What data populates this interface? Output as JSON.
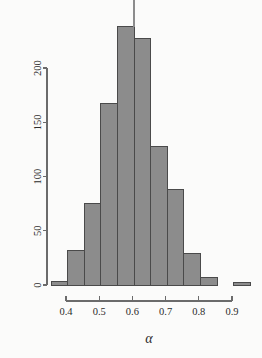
{
  "chart_data": {
    "type": "bar",
    "title": "",
    "subtitle": "",
    "xlabel": "α",
    "ylabel": "",
    "grid": false,
    "legend": false,
    "legend_position": "none",
    "bin_width": 0.05,
    "xlim": [
      0.355,
      0.955
    ],
    "ylim": [
      0,
      245
    ],
    "xticks": [
      0.4,
      0.5,
      0.6,
      0.7,
      0.8,
      0.9
    ],
    "xtick_labels": [
      "0.4",
      "0.5",
      "0.6",
      "0.7",
      "0.8",
      "0.9"
    ],
    "yticks": [
      0,
      50,
      100,
      150,
      200
    ],
    "ytick_labels": [
      "0",
      "50",
      "100",
      "150",
      "200"
    ],
    "bin_edges": [
      0.355,
      0.405,
      0.455,
      0.505,
      0.555,
      0.605,
      0.655,
      0.705,
      0.755,
      0.805,
      0.855,
      0.905,
      0.955
    ],
    "categories": [
      "0.355-0.405",
      "0.405-0.455",
      "0.455-0.505",
      "0.505-0.555",
      "0.555-0.605",
      "0.605-0.655",
      "0.655-0.705",
      "0.705-0.755",
      "0.755-0.805",
      "0.805-0.855",
      "0.855-0.905",
      "0.905-0.955"
    ],
    "values": [
      3,
      32,
      75,
      167,
      238,
      227,
      128,
      88,
      29,
      7,
      0,
      2
    ],
    "bar_fill": "#8c8c8c",
    "bar_stroke": "#4a4a4a",
    "axis_color": "#6b6b6b",
    "text_color": "#2b2b2b",
    "background": "#fbfbfa",
    "marker": {
      "name": "median-tick",
      "x": 0.605,
      "from_value": 238,
      "to_value": 268,
      "color": "#8c8c8c"
    }
  }
}
